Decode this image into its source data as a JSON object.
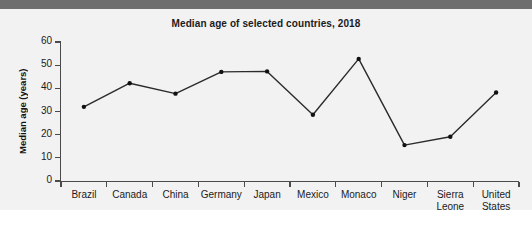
{
  "chart_data": {
    "type": "line",
    "title": "Median age of selected countries, 2018",
    "xlabel": "",
    "ylabel": "Median age (years)",
    "categories": [
      "Brazil",
      "Canada",
      "China",
      "Germany",
      "Japan",
      "Mexico",
      "Monaco",
      "Niger",
      "Sierra Leone",
      "United States"
    ],
    "values": [
      32.0,
      42.2,
      37.7,
      47.1,
      47.3,
      28.6,
      52.7,
      15.5,
      19.1,
      38.2
    ],
    "ylim": [
      0,
      60
    ],
    "yticks": [
      0,
      10,
      20,
      30,
      40,
      50,
      60
    ],
    "ytick_labels": [
      "0",
      "10",
      "20",
      "30",
      "40",
      "50",
      "60"
    ],
    "grid": false,
    "legend": false,
    "marker": "circle",
    "line_color": "#2b2b2b",
    "marker_color": "#111111",
    "plot_background": "#f2f2f2"
  },
  "colors": {
    "top_band": "#6e6e6e",
    "figure_background": "#f2f2f2",
    "page_background": "#ffffff",
    "axis": "#4b4b4b",
    "text": "#1b1b1b"
  }
}
